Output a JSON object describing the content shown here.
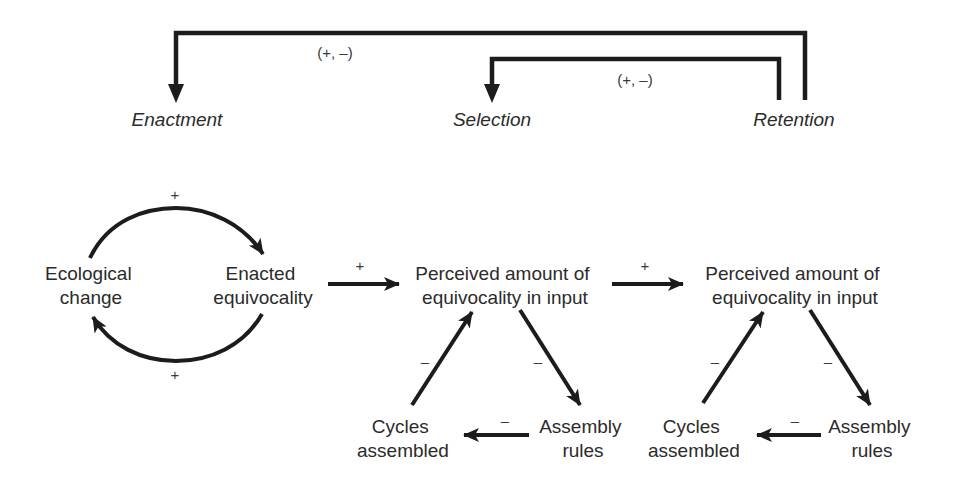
{
  "diagram": {
    "stages": {
      "enactment": "Enactment",
      "selection": "Selection",
      "retention": "Retention"
    },
    "feedback_labels": {
      "retention_to_enactment": "(+, –)",
      "retention_to_selection": "(+, –)"
    },
    "nodes": {
      "ecological_change": [
        "Ecological",
        "change"
      ],
      "enacted_equivocality": [
        "Enacted",
        "equivocality"
      ],
      "selection_perceived": [
        "Perceived amount of",
        "equivocality in input"
      ],
      "selection_cycles": [
        "Cycles",
        "assembled"
      ],
      "selection_rules": [
        "Assembly",
        "rules"
      ],
      "retention_perceived": [
        "Perceived amount of",
        "equivocality in input"
      ],
      "retention_cycles": [
        "Cycles",
        "assembled"
      ],
      "retention_rules": [
        "Assembly",
        "rules"
      ]
    },
    "signs": {
      "ecological_to_enacted": "+",
      "enacted_to_ecological": "+",
      "enacted_to_perceived": "+",
      "perceived_to_perceived": "+",
      "selection_cycles_to_perceived": "–",
      "selection_perceived_to_rules": "–",
      "selection_rules_to_cycles": "–",
      "retention_cycles_to_perceived": "–",
      "retention_perceived_to_rules": "–",
      "retention_rules_to_cycles": "–"
    },
    "colors": {
      "line": "#1c1c1c",
      "text": "#2b2b2b"
    }
  }
}
